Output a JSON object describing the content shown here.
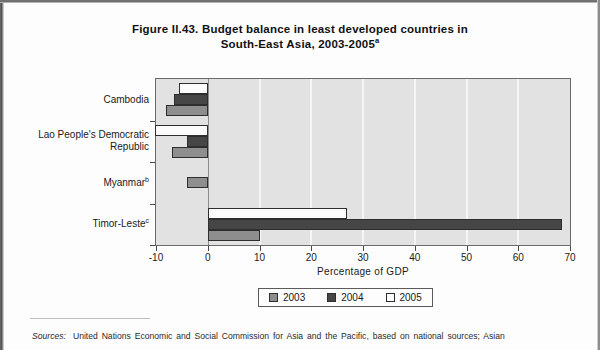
{
  "figure": {
    "title_line1": "Figure II.43. Budget balance in least developed countries in",
    "title_line2": "South-East Asia, 2003-2005",
    "title_superscript": "a"
  },
  "source": {
    "label": "Sources:",
    "text": "United Nations Economic and Social Commission for Asia and the Pacific, based on national sources; Asian"
  },
  "legend": {
    "items": [
      {
        "label": "2003",
        "color": "#8e8e8e",
        "name": "legend-item-2003"
      },
      {
        "label": "2004",
        "color": "#464646",
        "name": "legend-item-2004"
      },
      {
        "label": "2005",
        "color": "#fbfbfb",
        "name": "legend-item-2005"
      }
    ]
  },
  "chart_data": {
    "type": "bar",
    "orientation": "horizontal",
    "title": "Figure II.43. Budget balance in least developed countries in South-East Asia, 2003-2005a",
    "xlabel": "Percentage of GDP",
    "ylabel": "",
    "xlim": [
      -10,
      70
    ],
    "xticks": [
      -10,
      0,
      10,
      20,
      30,
      40,
      50,
      60,
      70
    ],
    "xticklabels": [
      "-10",
      "0",
      "10",
      "20",
      "30",
      "40",
      "50",
      "60",
      "70"
    ],
    "grid": "vertical-white-gridlines",
    "legend_position": "below-axis-center",
    "categories": [
      "Cambodia",
      "Lao People's Democratic Republic",
      "Myanmar",
      "Timor-Leste"
    ],
    "category_superscripts": [
      "",
      "",
      "b",
      "c"
    ],
    "category_labels": [
      {
        "line1": "Cambodia",
        "line2": "",
        "sup": ""
      },
      {
        "line1": "Lao People's Democratic",
        "line2": "Republic",
        "sup": ""
      },
      {
        "line1": "Myanmar",
        "line2": "",
        "sup": "b"
      },
      {
        "line1": "Timor-Leste",
        "line2": "",
        "sup": "c"
      }
    ],
    "series": [
      {
        "name": "2003",
        "color": "#8e8e8e",
        "values": [
          -8.0,
          -7.0,
          -4.0,
          10.0
        ]
      },
      {
        "name": "2004",
        "color": "#464646",
        "values": [
          -6.5,
          -4.0,
          null,
          68.5
        ]
      },
      {
        "name": "2005",
        "color": "#fbfbfb",
        "values": [
          -5.5,
          -10.2,
          null,
          27.0
        ]
      }
    ]
  }
}
